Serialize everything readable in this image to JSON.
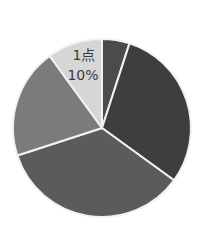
{
  "chart_data": {
    "type": "pie",
    "title": "",
    "start_angle_deg": 0,
    "direction": "clockwise",
    "center": [
      102,
      128
    ],
    "radius": 89,
    "slices": [
      {
        "name": "slice-a",
        "value": 5,
        "color": "#4b4b4b",
        "label": ""
      },
      {
        "name": "slice-b",
        "value": 30,
        "color": "#3e3e3e",
        "label": ""
      },
      {
        "name": "slice-c",
        "value": 35,
        "color": "#5b5b5b",
        "label": ""
      },
      {
        "name": "slice-d",
        "value": 20,
        "color": "#7b7b7b",
        "label": ""
      },
      {
        "name": "slice-e",
        "value": 10,
        "color": "#d6d6d6",
        "label": "1点",
        "percent_label": "10%"
      }
    ],
    "separator_color": "#f2f2f2",
    "legend": null
  },
  "labels": {
    "slice_e_category": "1点",
    "slice_e_percent": "10%"
  }
}
